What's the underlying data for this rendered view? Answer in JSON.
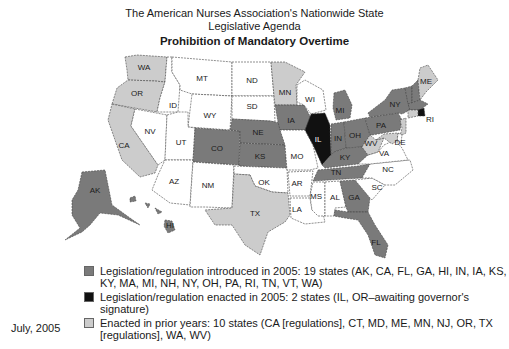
{
  "header": {
    "title_line1": "The American Nurses Association's Nationwide State",
    "title_line2": "Legislative Agenda",
    "subtitle": "Prohibition of Mandatory Overtime"
  },
  "colors": {
    "introduced": "#7a7a7a",
    "enacted_2005": "#111111",
    "enacted_prior": "#cccccc",
    "none": "#ffffff"
  },
  "legend": {
    "items": [
      {
        "key": "introduced",
        "label_line1": "Legislation/regulation introduced in 2005: 19 states (AK, CA, FL, GA, HI, IN, IA, KS,",
        "label_line2": "KY, MA, MI, NH, NY, OH, PA, RI, TN, VT, WA)"
      },
      {
        "key": "enacted_2005",
        "label_line1": "Legislation/regulation enacted in 2005: 2 states (IL, OR–awaiting governor's signature)",
        "label_line2": ""
      },
      {
        "key": "enacted_prior",
        "label_line1": "Enacted in prior years: 10 states (CA [regulations], CT, MD, ME, MN, NJ, OR, TX",
        "label_line2": "[regulations], WA, WV)"
      }
    ]
  },
  "footer": {
    "date": "July, 2005"
  },
  "map": {
    "states": [
      {
        "code": "WA",
        "status": "enacted_prior"
      },
      {
        "code": "OR",
        "status": "enacted_prior"
      },
      {
        "code": "CA",
        "status": "enacted_prior"
      },
      {
        "code": "ID",
        "status": "none"
      },
      {
        "code": "NV",
        "status": "none"
      },
      {
        "code": "MT",
        "status": "none"
      },
      {
        "code": "WY",
        "status": "none"
      },
      {
        "code": "UT",
        "status": "none"
      },
      {
        "code": "AZ",
        "status": "none"
      },
      {
        "code": "CO",
        "status": "introduced"
      },
      {
        "code": "NM",
        "status": "none"
      },
      {
        "code": "ND",
        "status": "none"
      },
      {
        "code": "SD",
        "status": "none"
      },
      {
        "code": "NE",
        "status": "introduced"
      },
      {
        "code": "KS",
        "status": "introduced"
      },
      {
        "code": "OK",
        "status": "none"
      },
      {
        "code": "TX",
        "status": "enacted_prior"
      },
      {
        "code": "MN",
        "status": "enacted_prior"
      },
      {
        "code": "IA",
        "status": "introduced"
      },
      {
        "code": "MO",
        "status": "none"
      },
      {
        "code": "AR",
        "status": "none"
      },
      {
        "code": "LA",
        "status": "none"
      },
      {
        "code": "WI",
        "status": "none"
      },
      {
        "code": "IL",
        "status": "enacted_2005"
      },
      {
        "code": "MS",
        "status": "none"
      },
      {
        "code": "MI",
        "status": "introduced"
      },
      {
        "code": "IN",
        "status": "introduced"
      },
      {
        "code": "OH",
        "status": "introduced"
      },
      {
        "code": "KY",
        "status": "introduced"
      },
      {
        "code": "TN",
        "status": "introduced"
      },
      {
        "code": "AL",
        "status": "none"
      },
      {
        "code": "GA",
        "status": "introduced"
      },
      {
        "code": "FL",
        "status": "introduced"
      },
      {
        "code": "SC",
        "status": "none"
      },
      {
        "code": "NC",
        "status": "none"
      },
      {
        "code": "VA",
        "status": "none"
      },
      {
        "code": "WV",
        "status": "enacted_prior"
      },
      {
        "code": "PA",
        "status": "introduced"
      },
      {
        "code": "NY",
        "status": "introduced"
      },
      {
        "code": "VT",
        "status": "introduced"
      },
      {
        "code": "NH",
        "status": "introduced"
      },
      {
        "code": "ME",
        "status": "enacted_prior"
      },
      {
        "code": "MA",
        "status": "introduced"
      },
      {
        "code": "RI",
        "status": "enacted_2005"
      },
      {
        "code": "CT",
        "status": "enacted_prior"
      },
      {
        "code": "NJ",
        "status": "enacted_prior"
      },
      {
        "code": "DE",
        "status": "none"
      },
      {
        "code": "MD",
        "status": "enacted_prior"
      },
      {
        "code": "AK",
        "status": "introduced"
      },
      {
        "code": "HI",
        "status": "introduced"
      }
    ]
  }
}
